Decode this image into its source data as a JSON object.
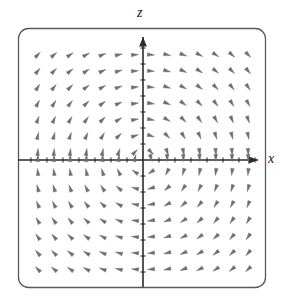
{
  "figure": {
    "name": "direction-field-plot",
    "kind": "vector-field",
    "background_color": "#ffffff"
  },
  "frame": {
    "name": "plot-frame",
    "x": 18,
    "y": 28,
    "width": 248,
    "height": 260,
    "corner_radius": 10,
    "stroke_color": "#5a5a5a",
    "stroke_width": 1.3
  },
  "axes": {
    "horizontal": {
      "label": "x",
      "label_color": "#1a1a1a",
      "y_pixel": 160,
      "x_start": 18,
      "x_end": 262,
      "arrowhead": true,
      "color": "#2b2b2b",
      "stroke_width": 1.6
    },
    "vertical": {
      "label": "z",
      "label_color": "#1a1a1a",
      "x_pixel": 143,
      "y_start": 286,
      "y_end": 33,
      "arrowhead": true,
      "color": "#2b2b2b",
      "stroke_width": 1.6
    },
    "tick_color": "#2b2b2b",
    "tick_length": 5,
    "tick_spacing": 16
  },
  "chart_data": {
    "type": "scatter",
    "title": "",
    "subtitle": "",
    "xlabel": "x",
    "ylabel": "z",
    "xlim": [
      -7.5,
      7.5
    ],
    "ylim": [
      -8,
      7.5
    ],
    "grid": false,
    "legend": null,
    "annotations": [],
    "field": {
      "description": "rotational direction field, arrows circulate clockwise about the origin",
      "arrow_color": "#6f6f6f",
      "arrow_length": 7.2,
      "head_width": 3.6,
      "columns": 14,
      "rows": 15,
      "x_values": [
        -7,
        -6,
        -5,
        -4,
        -3,
        -2,
        -1,
        1,
        2,
        3,
        4,
        5,
        6,
        7
      ],
      "z_values": [
        7,
        6,
        5,
        4,
        3,
        2,
        1,
        0,
        -1,
        -2,
        -3,
        -4,
        -5,
        -6,
        -7
      ],
      "x_pixel_start": 33,
      "x_pixel_step": 16.2,
      "x_pixel_gap_at_axis": 143,
      "z_pixel_start": 44,
      "z_pixel_step": 16.2,
      "vector_model": "clockwise rotation: u = z, w = -x (normalized per-arrow)"
    }
  }
}
